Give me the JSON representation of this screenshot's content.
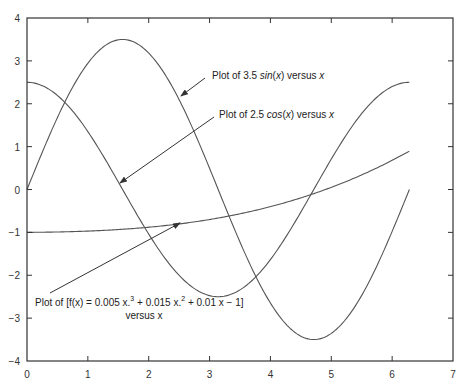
{
  "chart_data": {
    "type": "line",
    "title": "",
    "xlabel": "",
    "ylabel": "",
    "xlim": [
      0,
      7
    ],
    "ylim": [
      -4,
      4
    ],
    "grid": false,
    "legend": null,
    "x_ticks": [
      "0",
      "1",
      "2",
      "3",
      "4",
      "5",
      "6",
      "7"
    ],
    "y_ticks": [
      "4",
      "3",
      "2",
      "1",
      "0",
      "−1",
      "−2",
      "−3",
      "−4"
    ],
    "x_range": [
      0,
      6.2832
    ],
    "series": [
      {
        "name": "3.5 sin(x)",
        "function": "3.5*sin(x)",
        "amplitude": 3.5,
        "x": [
          0,
          0.5,
          1,
          1.5,
          2,
          2.5,
          3,
          3.5,
          4,
          4.5,
          5,
          5.5,
          6,
          6.28
        ],
        "values": [
          0,
          1.68,
          2.95,
          3.49,
          3.18,
          2.09,
          0.49,
          -1.23,
          -2.65,
          -3.42,
          -3.36,
          -2.47,
          -0.98,
          0
        ]
      },
      {
        "name": "2.5 cos(x)",
        "function": "2.5*cos(x)",
        "amplitude": 2.5,
        "x": [
          0,
          0.5,
          1,
          1.5,
          2,
          2.5,
          3,
          3.5,
          4,
          4.5,
          5,
          5.5,
          6,
          6.28
        ],
        "values": [
          2.5,
          2.19,
          1.35,
          0.18,
          -1.04,
          -2.0,
          -2.47,
          -2.34,
          -1.63,
          -0.53,
          0.71,
          1.77,
          2.4,
          2.5
        ]
      },
      {
        "name": "f(x) = 0.005x^3 + 0.015x^2 + 0.01x - 1",
        "function": "0.005*x^3+0.015*x^2+0.01*x-1",
        "x": [
          0,
          1,
          2,
          3,
          4,
          5,
          6,
          6.28
        ],
        "values": [
          -1,
          -0.97,
          -0.88,
          -0.7,
          -0.4,
          0.0,
          0.54,
          0.83
        ]
      }
    ],
    "annotations": [
      {
        "text_parts": [
          "Plot of 3.5 ",
          "sin",
          "(",
          "x",
          ") versus ",
          "x"
        ],
        "arrow_to_series": "3.5 sin(x)"
      },
      {
        "text_parts": [
          "Plot of 2.5 ",
          "cos",
          "(",
          "x",
          ") versus ",
          "x"
        ],
        "arrow_to_series": "2.5 cos(x)"
      },
      {
        "line1": "Plot of [f(x) = 0.005 x.",
        "sup1": "3",
        "mid1": " + 0.015 x.",
        "sup2": "2",
        "end1": " + 0.01 x − 1]",
        "line2": "versus x",
        "arrow_to_series": "f(x)"
      }
    ]
  },
  "style": {
    "curve_color": "#555555",
    "axis_color": "#333333",
    "arrow_color": "#333333"
  }
}
